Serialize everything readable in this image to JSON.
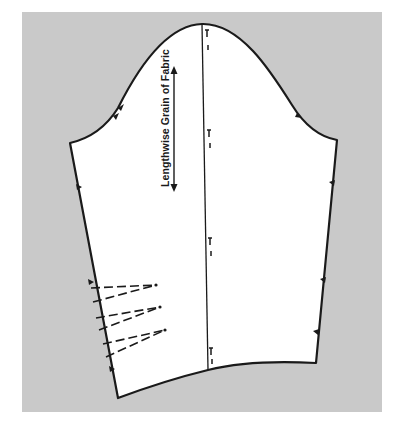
{
  "figure": {
    "type": "sewing-pattern",
    "grain_label": "Lengthwise Grain of Fabric",
    "colors": {
      "background_panel": "#c9c9c9",
      "pattern_piece": "#ffffff",
      "lines": "#1a1a1a"
    },
    "elements": {
      "center_line": "straight vertical line from cap to hem",
      "center_line_markers": 4,
      "notches_left": 4,
      "notches_right": 4,
      "elbow_darts": 3,
      "grain_arrow": "double-headed vertical arrow"
    }
  }
}
